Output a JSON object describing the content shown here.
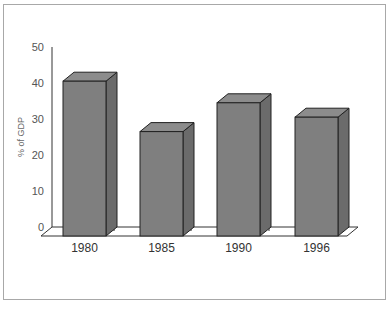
{
  "chart_data": {
    "type": "bar",
    "style": "3d-column",
    "title": "",
    "xlabel": "",
    "ylabel": "% of GDP",
    "categories": [
      "1980",
      "1985",
      "1990",
      "1996"
    ],
    "values": [
      43,
      29,
      37,
      33
    ],
    "ylim": [
      0,
      50
    ],
    "yticks": [
      "0",
      "10",
      "20",
      "30",
      "40",
      "50"
    ],
    "grid": false,
    "legend": null,
    "colors": {
      "bar_front": "#7f7f7f",
      "bar_side": "#6b6b6b",
      "bar_top": "#8c8c8c",
      "outline": "#222222",
      "frame": "#a8a8a8"
    }
  }
}
